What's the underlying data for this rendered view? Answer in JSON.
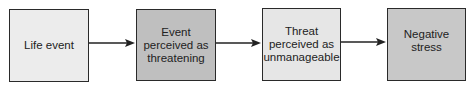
{
  "diagram": {
    "type": "flowchart",
    "direction": "left-to-right",
    "nodes": [
      {
        "id": "life-event",
        "label": "Life event",
        "fill": "#ececec"
      },
      {
        "id": "event-perceived-threatening",
        "label": "Event\nperceived as\nthreatening",
        "fill": "#bfbfbf"
      },
      {
        "id": "threat-perceived-unmanageable",
        "label": "Threat\nperceived as\nunmanageable",
        "fill": "#e6e6e6"
      },
      {
        "id": "negative-stress",
        "label": "Negative\nstress",
        "fill": "#c8c8c8"
      }
    ],
    "edges": [
      {
        "from": "life-event",
        "to": "event-perceived-threatening"
      },
      {
        "from": "event-perceived-threatening",
        "to": "threat-perceived-unmanageable"
      },
      {
        "from": "threat-perceived-unmanageable",
        "to": "negative-stress"
      }
    ],
    "colors": {
      "border": "#2a2a2a",
      "arrow": "#222222",
      "text": "#222222"
    }
  }
}
